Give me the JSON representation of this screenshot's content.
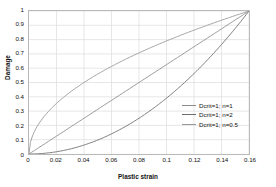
{
  "chart_data": {
    "type": "line",
    "title": "",
    "xlabel": "Plastic strain",
    "ylabel": "Damage",
    "xlim": [
      0,
      0.16
    ],
    "ylim": [
      0,
      1
    ],
    "grid": true,
    "legend_position": "lower-right-inside",
    "xticks": [
      "0",
      "0.02",
      "0.04",
      "0.06",
      "0.08",
      "0.1",
      "0.12",
      "0.14",
      "0.16"
    ],
    "xtick_values": [
      0,
      0.02,
      0.04,
      0.06,
      0.08,
      0.1,
      0.12,
      0.14,
      0.16
    ],
    "yticks": [
      "0",
      "0.1",
      "0.2",
      "0.3",
      "0.4",
      "0.5",
      "0.6",
      "0.7",
      "0.8",
      "0.9",
      "1"
    ],
    "ytick_values": [
      0,
      0.1,
      0.2,
      0.3,
      0.4,
      0.5,
      0.6,
      0.7,
      0.8,
      0.9,
      1
    ],
    "series": [
      {
        "name": "Dcrit=1; n=1",
        "color": "#8c8c8c",
        "exponent": 1,
        "x": [
          0,
          0.01,
          0.02,
          0.03,
          0.04,
          0.05,
          0.06,
          0.07,
          0.08,
          0.09,
          0.1,
          0.11,
          0.12,
          0.13,
          0.14,
          0.15,
          0.16
        ],
        "y": [
          0,
          0.0625,
          0.125,
          0.1875,
          0.25,
          0.3125,
          0.375,
          0.4375,
          0.5,
          0.5625,
          0.625,
          0.6875,
          0.75,
          0.8125,
          0.875,
          0.9375,
          1
        ]
      },
      {
        "name": "Dcrit=1; n=2",
        "color": "#6e6e6e",
        "exponent": 2,
        "x": [
          0,
          0.01,
          0.02,
          0.03,
          0.04,
          0.05,
          0.06,
          0.07,
          0.08,
          0.09,
          0.1,
          0.11,
          0.12,
          0.13,
          0.14,
          0.15,
          0.16
        ],
        "y": [
          0,
          0.0039,
          0.0156,
          0.0352,
          0.0625,
          0.0977,
          0.1406,
          0.1914,
          0.25,
          0.3164,
          0.3906,
          0.4727,
          0.5625,
          0.6602,
          0.7656,
          0.8789,
          1
        ]
      },
      {
        "name": "Dcrit=1; n=0.5",
        "color": "#9a9a9a",
        "exponent": 0.5,
        "x": [
          0,
          0.01,
          0.02,
          0.03,
          0.04,
          0.05,
          0.06,
          0.07,
          0.08,
          0.09,
          0.1,
          0.11,
          0.12,
          0.13,
          0.14,
          0.15,
          0.16
        ],
        "y": [
          0,
          0.25,
          0.3536,
          0.433,
          0.5,
          0.559,
          0.6124,
          0.6614,
          0.7071,
          0.75,
          0.7906,
          0.8292,
          0.866,
          0.9014,
          0.9354,
          0.9682,
          1
        ]
      }
    ]
  },
  "legend": {
    "items": [
      {
        "label": "Dcrit=1; n=1"
      },
      {
        "label": "Dcrit=1; n=2"
      },
      {
        "label": "Dcrit=1; n=0.5"
      }
    ]
  }
}
